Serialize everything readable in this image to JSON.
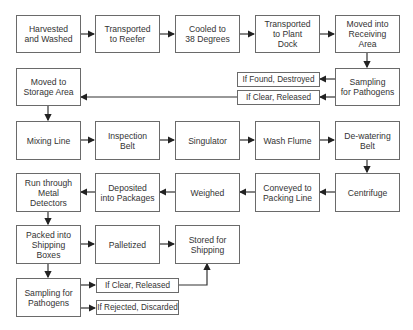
{
  "diagram": {
    "type": "flowchart",
    "nodes": {
      "harvested": "Harvested\nand Washed",
      "reefer": "Transported\nto Reefer",
      "cooled": "Cooled to\n38 Degrees",
      "plant_dock": "Transported\nto Plant\nDock",
      "receiving": "Moved into\nReceiving\nArea",
      "sampling1": "Sampling\nfor Pathogens",
      "found_destroyed": "If Found, Destroyed",
      "clear_released1": "If Clear, Released",
      "storage": "Moved to\nStorage Area",
      "mixing": "Mixing Line",
      "inspection": "Inspection\nBelt",
      "singulator": "Singulator",
      "wash_flume": "Wash Flume",
      "dewatering": "De-watering\nBelt",
      "centrifuge": "Centrifuge",
      "conveyed": "Conveyed to\nPacking Line",
      "weighed": "Weighed",
      "deposited": "Deposited\ninto Packages",
      "metal": "Run through\nMetal\nDetectors",
      "packed": "Packed into\nShipping\nBoxes",
      "palletized": "Palletized",
      "stored": "Stored for\nShipping",
      "sampling2": "Sampling for\nPathogens",
      "clear_released2": "If Clear, Released",
      "rejected": "If Rejected, Discarded"
    },
    "edges": [
      [
        "harvested",
        "reefer"
      ],
      [
        "reefer",
        "cooled"
      ],
      [
        "cooled",
        "plant_dock"
      ],
      [
        "plant_dock",
        "receiving"
      ],
      [
        "receiving",
        "sampling1"
      ],
      [
        "sampling1",
        "found_destroyed"
      ],
      [
        "sampling1",
        "clear_released1"
      ],
      [
        "clear_released1",
        "storage"
      ],
      [
        "storage",
        "mixing"
      ],
      [
        "mixing",
        "inspection"
      ],
      [
        "inspection",
        "singulator"
      ],
      [
        "singulator",
        "wash_flume"
      ],
      [
        "wash_flume",
        "dewatering"
      ],
      [
        "dewatering",
        "centrifuge"
      ],
      [
        "centrifuge",
        "conveyed"
      ],
      [
        "conveyed",
        "weighed"
      ],
      [
        "weighed",
        "deposited"
      ],
      [
        "deposited",
        "metal"
      ],
      [
        "metal",
        "packed"
      ],
      [
        "packed",
        "palletized"
      ],
      [
        "palletized",
        "stored"
      ],
      [
        "packed",
        "sampling2"
      ],
      [
        "sampling2",
        "clear_released2"
      ],
      [
        "sampling2",
        "rejected"
      ],
      [
        "clear_released2",
        "stored"
      ]
    ]
  }
}
